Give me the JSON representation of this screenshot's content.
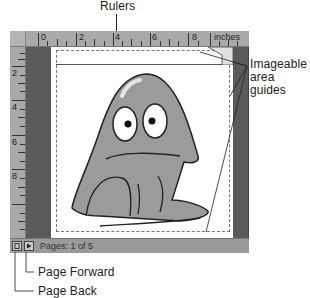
{
  "callouts": {
    "rulers": "Rulers",
    "imageable_line1": "Imageable",
    "imageable_line2": "area guides",
    "page_forward": "Page Forward",
    "page_back": "Page Back"
  },
  "ruler_top": {
    "labels": [
      "0",
      "2",
      "4",
      "6",
      "8"
    ],
    "units": "inches"
  },
  "ruler_left": {
    "labels": [
      "2",
      "4",
      "6",
      "8"
    ]
  },
  "statusbar": {
    "pages_text": "Pages: 1 of 5",
    "back_icon": "page-back-icon",
    "forward_icon": "page-forward-icon"
  },
  "colors": {
    "ruler": "#a9a9a9",
    "pasteboard": "#5a5a5a",
    "page": "#ffffff",
    "statusbar": "#9a9a9a",
    "character_fill": "#9b9b9b"
  }
}
